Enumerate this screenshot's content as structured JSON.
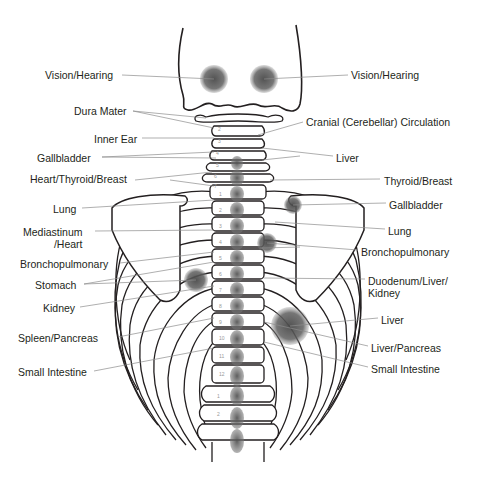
{
  "labels_left": [
    {
      "id": "vision-hearing-left",
      "text": "Vision/Hearing",
      "x": 45,
      "y": 69
    },
    {
      "id": "dura-mater",
      "text": "Dura Mater",
      "x": 74,
      "y": 105
    },
    {
      "id": "inner-ear",
      "text": "Inner Ear",
      "x": 94,
      "y": 133
    },
    {
      "id": "gallbladder-left",
      "text": "Gallbladder",
      "x": 37,
      "y": 152
    },
    {
      "id": "heart-thyroid-breast",
      "text": "Heart/Thyroid/Breast",
      "x": 30,
      "y": 173
    },
    {
      "id": "lung-left",
      "text": "Lung",
      "x": 53,
      "y": 203
    },
    {
      "id": "mediastinum-heart",
      "text": "Mediastinum\n/Heart",
      "x": 23,
      "y": 226
    },
    {
      "id": "bronchopulmonary-left",
      "text": "Bronchopulmonary",
      "x": 20,
      "y": 258
    },
    {
      "id": "stomach",
      "text": "Stomach",
      "x": 35,
      "y": 279
    },
    {
      "id": "kidney",
      "text": "Kidney",
      "x": 43,
      "y": 302
    },
    {
      "id": "spleen-pancreas",
      "text": "Spleen/Pancreas",
      "x": 18,
      "y": 332
    },
    {
      "id": "small-intestine-left",
      "text": "Small Intestine",
      "x": 18,
      "y": 366
    }
  ],
  "labels_right": [
    {
      "id": "vision-hearing-right",
      "text": "Vision/Hearing",
      "x": 351,
      "y": 69
    },
    {
      "id": "cranial-circulation",
      "text": "Cranial (Cerebellar) Circulation",
      "x": 306,
      "y": 116
    },
    {
      "id": "liver-upper",
      "text": "Liver",
      "x": 336,
      "y": 152
    },
    {
      "id": "thyroid-breast",
      "text": "Thyroid/Breast",
      "x": 384,
      "y": 175
    },
    {
      "id": "gallbladder-right",
      "text": "Gallbladder",
      "x": 389,
      "y": 199
    },
    {
      "id": "lung-right",
      "text": "Lung",
      "x": 388,
      "y": 225
    },
    {
      "id": "bronchopulmonary-right",
      "text": "Bronchopulmonary",
      "x": 361,
      "y": 246
    },
    {
      "id": "duodenum-liver-kidney",
      "text": "Duodenum/Liver/\nKidney",
      "x": 368,
      "y": 275
    },
    {
      "id": "liver-lower",
      "text": "Liver",
      "x": 381,
      "y": 314
    },
    {
      "id": "liver-pancreas",
      "text": "Liver/Pancreas",
      "x": 371,
      "y": 342
    },
    {
      "id": "small-intestine-right",
      "text": "Small Intestine",
      "x": 371,
      "y": 363
    }
  ],
  "vertebra_numbers": {
    "cervical": [
      "1",
      "2",
      "3",
      "4",
      "5",
      "6",
      "7"
    ],
    "thoracic": [
      "1",
      "2",
      "3",
      "4",
      "5",
      "6",
      "7",
      "8",
      "9",
      "10",
      "11",
      "12"
    ],
    "lumbar": [
      "1",
      "2"
    ]
  },
  "highlight_spots": [
    {
      "id": "spot-vision-left",
      "cx": 214,
      "cy": 79,
      "r": 14
    },
    {
      "id": "spot-vision-right",
      "cx": 264,
      "cy": 79,
      "r": 14
    },
    {
      "id": "spot-stomach",
      "cx": 196,
      "cy": 280,
      "r": 12
    },
    {
      "id": "spot-gallbladder",
      "cx": 293,
      "cy": 205,
      "r": 9
    },
    {
      "id": "spot-bronchopulmonary",
      "cx": 267,
      "cy": 243,
      "r": 10
    },
    {
      "id": "spot-liver",
      "cx": 290,
      "cy": 326,
      "r": 19
    }
  ],
  "colors": {
    "line": "#231f20",
    "leader": "#8c8c8c",
    "spot": "#595959",
    "text": "#231f20"
  }
}
